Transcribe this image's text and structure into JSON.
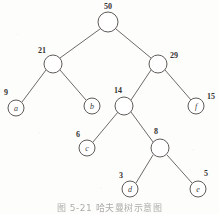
{
  "figure": {
    "type": "huffman-tree",
    "caption": "图 5-21  哈夫曼树示意图",
    "stroke_color": "#6d6a68",
    "text_color": "#353332",
    "background_color": "#fdfdfc"
  },
  "nodes": [
    {
      "id": "n50",
      "label": "50",
      "kind": "internal",
      "weight": 50,
      "cx": 108,
      "cy": 22,
      "r": 10,
      "label_x": 108,
      "label_y": 6
    },
    {
      "id": "n21",
      "label": "21",
      "kind": "internal",
      "weight": 21,
      "cx": 53,
      "cy": 64,
      "r": 9,
      "label_x": 42,
      "label_y": 50
    },
    {
      "id": "n29",
      "label": "29",
      "kind": "internal",
      "weight": 29,
      "cx": 158,
      "cy": 64,
      "r": 9,
      "label_x": 174,
      "label_y": 55
    },
    {
      "id": "na",
      "label": "a",
      "kind": "leaf",
      "weight": 9,
      "cx": 16,
      "cy": 108,
      "r": 8,
      "label_x": 6,
      "label_y": 92
    },
    {
      "id": "nb",
      "label": "b",
      "kind": "leaf",
      "weight": null,
      "cx": 92,
      "cy": 106,
      "r": 8,
      "label_x": null,
      "label_y": null
    },
    {
      "id": "n14",
      "label": "14",
      "kind": "internal",
      "weight": 14,
      "cx": 124,
      "cy": 106,
      "r": 9,
      "label_x": 118,
      "label_y": 90
    },
    {
      "id": "nf",
      "label": "f",
      "kind": "leaf",
      "weight": 15,
      "cx": 196,
      "cy": 106,
      "r": 8,
      "label_x": 211,
      "label_y": 96
    },
    {
      "id": "nc",
      "label": "c",
      "kind": "leaf",
      "weight": 6,
      "cx": 87,
      "cy": 148,
      "r": 8,
      "label_x": 78,
      "label_y": 134
    },
    {
      "id": "n8",
      "label": "8",
      "kind": "internal",
      "weight": 8,
      "cx": 160,
      "cy": 148,
      "r": 9,
      "label_x": 156,
      "label_y": 131
    },
    {
      "id": "nd",
      "label": "d",
      "kind": "leaf",
      "weight": 3,
      "cx": 130,
      "cy": 189,
      "r": 8,
      "label_x": 121,
      "label_y": 175
    },
    {
      "id": "ne",
      "label": "e",
      "kind": "leaf",
      "weight": 5,
      "cx": 198,
      "cy": 189,
      "r": 8,
      "label_x": 206,
      "label_y": 173
    }
  ],
  "edges": [
    {
      "from": "n50",
      "to": "n21",
      "x1": 100,
      "y1": 29,
      "x2": 60,
      "y2": 58
    },
    {
      "from": "n50",
      "to": "n29",
      "x1": 116,
      "y1": 29,
      "x2": 151,
      "y2": 58
    },
    {
      "from": "n21",
      "to": "na",
      "x1": 46,
      "y1": 70,
      "x2": 22,
      "y2": 102
    },
    {
      "from": "n21",
      "to": "nb",
      "x1": 60,
      "y1": 70,
      "x2": 86,
      "y2": 100
    },
    {
      "from": "n29",
      "to": "n14",
      "x1": 151,
      "y1": 70,
      "x2": 131,
      "y2": 100
    },
    {
      "from": "n29",
      "to": "nf",
      "x1": 165,
      "y1": 70,
      "x2": 191,
      "y2": 100
    },
    {
      "from": "n14",
      "to": "nc",
      "x1": 118,
      "y1": 112,
      "x2": 93,
      "y2": 142
    },
    {
      "from": "n14",
      "to": "n8",
      "x1": 131,
      "y1": 112,
      "x2": 153,
      "y2": 142
    },
    {
      "from": "n8",
      "to": "nd",
      "x1": 153,
      "y1": 155,
      "x2": 136,
      "y2": 183
    },
    {
      "from": "n8",
      "to": "ne",
      "x1": 167,
      "y1": 155,
      "x2": 192,
      "y2": 183
    }
  ]
}
